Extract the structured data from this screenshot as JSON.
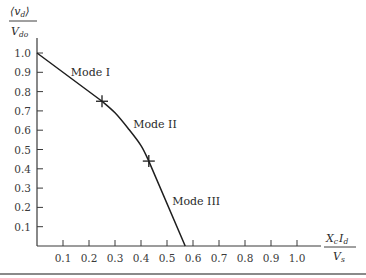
{
  "chart_data": {
    "type": "line",
    "title": "",
    "xlabel": "X_c I_d / V_s",
    "ylabel": "⟨v_d⟩ / V_do",
    "xlim": [
      0,
      1.05
    ],
    "ylim": [
      0,
      1.0
    ],
    "grid": false,
    "legend": null,
    "x_ticks": [
      "0.1",
      "0.2",
      "0.3",
      "0.4",
      "0.5",
      "0.6",
      "0.7",
      "0.8",
      "0.9",
      "1.0"
    ],
    "y_ticks": [
      "0.1",
      "0.2",
      "0.3",
      "0.4",
      "0.5",
      "0.6",
      "0.7",
      "0.8",
      "0.9",
      "1.0"
    ],
    "series": [
      {
        "name": "Output voltage characteristic",
        "x": [
          0.0,
          0.25,
          0.3,
          0.35,
          0.4,
          0.43,
          0.57
        ],
        "y": [
          1.0,
          0.75,
          0.69,
          0.61,
          0.52,
          0.44,
          0.0
        ]
      }
    ],
    "markers": [
      {
        "x": 0.25,
        "y": 0.75,
        "symbol": "+"
      },
      {
        "x": 0.43,
        "y": 0.44,
        "symbol": "+"
      }
    ],
    "annotations": [
      {
        "text": "Mode I",
        "x": 0.13,
        "y": 0.88
      },
      {
        "text": "Mode II",
        "x": 0.37,
        "y": 0.61
      },
      {
        "text": "Mode III",
        "x": 0.52,
        "y": 0.21
      }
    ]
  },
  "labels": {
    "y_num": "⟨v",
    "y_sub": "d",
    "y_close": "⟩",
    "y_den": "V",
    "y_den_sub": "do",
    "x_num_a": "X",
    "x_num_a_sub": "c",
    "x_num_b": "I",
    "x_num_b_sub": "d",
    "x_den": "V",
    "x_den_sub": "s"
  }
}
